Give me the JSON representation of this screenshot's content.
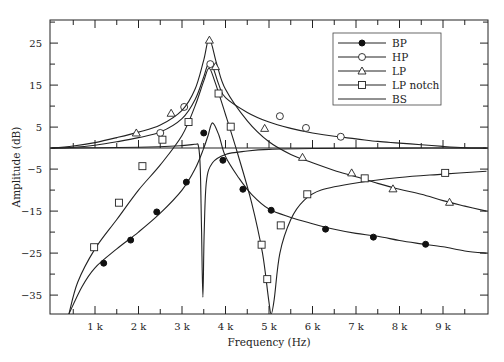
{
  "chart_data": {
    "type": "line",
    "title": "",
    "xlabel": "Frequency (Hz)",
    "ylabel": "Amplitude (dB)",
    "xlim": [
      0,
      10000
    ],
    "ylim": [
      -39.5,
      30.5
    ],
    "grid": false,
    "legend_position": "top-right",
    "x_ticks": [
      {
        "value": 1000,
        "label": "1 k"
      },
      {
        "value": 2000,
        "label": "2 k"
      },
      {
        "value": 3000,
        "label": "3 k"
      },
      {
        "value": 4000,
        "label": "4 k"
      },
      {
        "value": 5000,
        "label": "5 k"
      },
      {
        "value": 6000,
        "label": "6 k"
      },
      {
        "value": 7000,
        "label": "7 k"
      },
      {
        "value": 8000,
        "label": "8 k"
      },
      {
        "value": 9000,
        "label": "9 k"
      }
    ],
    "y_ticks": [
      {
        "value": 25,
        "label": "25"
      },
      {
        "value": 15,
        "label": "15"
      },
      {
        "value": 5,
        "label": "5"
      },
      {
        "value": -5,
        "label": "−5"
      },
      {
        "value": -15,
        "label": "−15"
      },
      {
        "value": -25,
        "label": "−25"
      },
      {
        "value": -35,
        "label": "−35"
      }
    ],
    "series": [
      {
        "name": "BP",
        "marker": "filled-circle",
        "curve": [
          [
            400,
            -39.5
          ],
          [
            700,
            -33
          ],
          [
            1000,
            -28.5
          ],
          [
            1500,
            -24
          ],
          [
            2000,
            -20
          ],
          [
            2500,
            -15.5
          ],
          [
            3000,
            -10
          ],
          [
            3300,
            -5
          ],
          [
            3500,
            0
          ],
          [
            3600,
            3
          ],
          [
            3700,
            6
          ],
          [
            3850,
            3
          ],
          [
            4000,
            -2
          ],
          [
            4300,
            -7
          ],
          [
            4600,
            -11
          ],
          [
            5000,
            -14.5
          ],
          [
            5500,
            -16.5
          ],
          [
            6000,
            -18
          ],
          [
            6500,
            -19.3
          ],
          [
            7000,
            -20.3
          ],
          [
            7500,
            -21
          ],
          [
            8000,
            -22
          ],
          [
            8500,
            -22.8
          ],
          [
            9000,
            -23.5
          ],
          [
            9500,
            -24.5
          ],
          [
            10000,
            -25
          ]
        ],
        "markers": [
          [
            1200,
            -27.4
          ],
          [
            1820,
            -21.9
          ],
          [
            2420,
            -15.2
          ],
          [
            3100,
            -8.1
          ],
          [
            3500,
            3.6
          ],
          [
            3940,
            -2.9
          ],
          [
            4400,
            -9.8
          ],
          [
            5050,
            -14.8
          ],
          [
            6300,
            -19.3
          ],
          [
            7400,
            -21.2
          ],
          [
            8600,
            -22.9
          ]
        ]
      },
      {
        "name": "HP",
        "marker": "open-circle",
        "curve": [
          [
            0,
            0
          ],
          [
            500,
            0.2
          ],
          [
            1000,
            0.7
          ],
          [
            1500,
            1.5
          ],
          [
            2000,
            2.5
          ],
          [
            2500,
            3.8
          ],
          [
            3000,
            7
          ],
          [
            3300,
            11.5
          ],
          [
            3500,
            17
          ],
          [
            3600,
            20
          ],
          [
            3700,
            19.5
          ],
          [
            3850,
            15
          ],
          [
            4000,
            12
          ],
          [
            4500,
            8.5
          ],
          [
            5000,
            6.2
          ],
          [
            5500,
            4.7
          ],
          [
            6000,
            3.6
          ],
          [
            6500,
            2.8
          ],
          [
            7000,
            2.2
          ],
          [
            7500,
            1.6
          ],
          [
            8000,
            1.2
          ],
          [
            8500,
            0.8
          ],
          [
            9000,
            0.4
          ],
          [
            9500,
            0.1
          ],
          [
            10000,
            0
          ]
        ],
        "markers": [
          [
            2500,
            3.6
          ],
          [
            3050,
            9.8
          ],
          [
            3650,
            20
          ],
          [
            5250,
            7.6
          ],
          [
            5850,
            4.8
          ],
          [
            6650,
            2.7
          ]
        ]
      },
      {
        "name": "LP",
        "marker": "open-triangle",
        "curve": [
          [
            0,
            0
          ],
          [
            500,
            0.5
          ],
          [
            1000,
            1.3
          ],
          [
            1500,
            2.5
          ],
          [
            2000,
            3.8
          ],
          [
            2500,
            5.5
          ],
          [
            3000,
            9
          ],
          [
            3300,
            14
          ],
          [
            3500,
            21
          ],
          [
            3630,
            26
          ],
          [
            3800,
            20
          ],
          [
            4000,
            14
          ],
          [
            4500,
            6.5
          ],
          [
            5000,
            1.5
          ],
          [
            5500,
            -1.5
          ],
          [
            6000,
            -3.5
          ],
          [
            6500,
            -5.3
          ],
          [
            7000,
            -6.8
          ],
          [
            7500,
            -8.4
          ],
          [
            8000,
            -9.8
          ],
          [
            8500,
            -11
          ],
          [
            9000,
            -12.5
          ],
          [
            9500,
            -13.8
          ],
          [
            10000,
            -15
          ]
        ],
        "markers": [
          [
            1950,
            3.6
          ],
          [
            2750,
            8.3
          ],
          [
            3630,
            25.7
          ],
          [
            3770,
            19.4
          ],
          [
            4900,
            4.7
          ],
          [
            5770,
            -2.2
          ],
          [
            6900,
            -5.9
          ],
          [
            7850,
            -9.7
          ],
          [
            9150,
            -12.9
          ]
        ]
      },
      {
        "name": "LP notch",
        "marker": "open-square",
        "curve": [
          [
            400,
            -39.5
          ],
          [
            600,
            -32
          ],
          [
            1000,
            -24
          ],
          [
            1500,
            -17
          ],
          [
            2000,
            -10
          ],
          [
            2500,
            -4
          ],
          [
            3000,
            3
          ],
          [
            3300,
            10
          ],
          [
            3500,
            16
          ],
          [
            3620,
            19
          ],
          [
            3750,
            16
          ],
          [
            4000,
            8
          ],
          [
            4300,
            -2
          ],
          [
            4600,
            -13
          ],
          [
            4850,
            -25
          ],
          [
            4990,
            -36
          ],
          [
            5050,
            -39.5
          ],
          [
            5120,
            -36
          ],
          [
            5250,
            -25
          ],
          [
            5500,
            -17
          ],
          [
            5800,
            -12.5
          ],
          [
            6200,
            -10
          ],
          [
            7000,
            -8.3
          ],
          [
            8000,
            -7
          ],
          [
            9000,
            -6.2
          ],
          [
            10000,
            -5.5
          ]
        ],
        "markers": [
          [
            980,
            -23.6
          ],
          [
            1550,
            -13
          ],
          [
            2090,
            -4.3
          ],
          [
            2550,
            2
          ],
          [
            3150,
            6.2
          ],
          [
            3840,
            13
          ],
          [
            4120,
            5.1
          ],
          [
            4830,
            -23
          ],
          [
            4960,
            -31.2
          ],
          [
            5270,
            -18.4
          ],
          [
            5880,
            -11
          ],
          [
            7200,
            -7.2
          ],
          [
            9050,
            -5.9
          ]
        ]
      },
      {
        "name": "BS",
        "marker": "none",
        "curve": [
          [
            0,
            0
          ],
          [
            2000,
            0.2
          ],
          [
            3000,
            0.6
          ],
          [
            3300,
            0.9
          ],
          [
            3380,
            0.4
          ],
          [
            3420,
            -5
          ],
          [
            3450,
            -20
          ],
          [
            3480,
            -35.5
          ],
          [
            3510,
            -20
          ],
          [
            3560,
            -8
          ],
          [
            3700,
            -3.5
          ],
          [
            4000,
            -1.5
          ],
          [
            4500,
            -0.7
          ],
          [
            5000,
            -0.3
          ],
          [
            6000,
            -0.1
          ],
          [
            8000,
            0
          ],
          [
            10000,
            0
          ]
        ],
        "markers": []
      }
    ]
  }
}
